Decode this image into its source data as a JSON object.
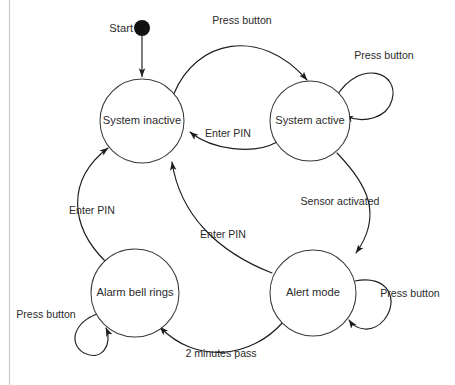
{
  "diagram": {
    "background_color": "#ffffff",
    "stroke_color": "#1d1d1d",
    "node_stroke_color": "#3a3a3a",
    "text_color": "#2b2b2b",
    "frame_color": "#c9c9c9",
    "start": {
      "label": "Start",
      "node_name": "start-node",
      "cx": 142,
      "cy": 28,
      "r": 8
    },
    "states": [
      {
        "id": "system-inactive",
        "label": "System inactive",
        "cx": 142,
        "cy": 121,
        "r": 42
      },
      {
        "id": "system-active",
        "label": "System active",
        "cx": 310,
        "cy": 121,
        "r": 40
      },
      {
        "id": "alarm-bell-rings",
        "label": "Alarm bell rings",
        "cx": 135,
        "cy": 293,
        "r": 44
      },
      {
        "id": "alert-mode",
        "label": "Alert mode",
        "cx": 313,
        "cy": 293,
        "r": 43
      }
    ],
    "transitions": [
      {
        "id": "start-to-inactive",
        "label": "",
        "from": "start",
        "to": "system-inactive"
      },
      {
        "id": "inactive-to-active",
        "label": "Press button",
        "from": "system-inactive",
        "to": "system-active",
        "label_x": 242,
        "label_y": 21
      },
      {
        "id": "active-self-loop",
        "label": "Press button",
        "from": "system-active",
        "to": "system-active",
        "label_x": 384,
        "label_y": 56
      },
      {
        "id": "active-to-inactive",
        "label": "Enter PIN",
        "from": "system-active",
        "to": "system-inactive",
        "label_x": 228,
        "label_y": 134
      },
      {
        "id": "active-to-alert",
        "label": "Sensor activated",
        "from": "system-active",
        "to": "alert-mode",
        "label_x": 340,
        "label_y": 202
      },
      {
        "id": "alert-self-loop",
        "label": "Press button",
        "from": "alert-mode",
        "to": "alert-mode",
        "label_x": 410,
        "label_y": 294
      },
      {
        "id": "alert-to-inactive",
        "label": "Enter PIN",
        "from": "alert-mode",
        "to": "system-inactive",
        "label_x": 223,
        "label_y": 235
      },
      {
        "id": "alert-to-alarm",
        "label": "2 minutes pass",
        "from": "alert-mode",
        "to": "alarm-bell-rings",
        "label_x": 221,
        "label_y": 354
      },
      {
        "id": "alarm-self-loop",
        "label": "Press button",
        "from": "alarm-bell-rings",
        "to": "alarm-bell-rings",
        "label_x": 46,
        "label_y": 315
      },
      {
        "id": "alarm-to-inactive",
        "label": "Enter PIN",
        "from": "alarm-bell-rings",
        "to": "system-inactive",
        "label_x": 92,
        "label_y": 211
      }
    ]
  }
}
